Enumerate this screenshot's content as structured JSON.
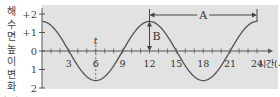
{
  "chart_data": {
    "type": "line",
    "title": "",
    "xlabel": "시간(시)",
    "ylabel": "해수면 높이 변화(m)",
    "ylabel_chars": [
      "해",
      "수",
      "면",
      "높",
      "이",
      "변",
      "화",
      "(m)"
    ],
    "xlim": [
      0,
      24
    ],
    "ylim": [
      -2,
      2
    ],
    "x_ticks": [
      3,
      6,
      9,
      12,
      15,
      18,
      21,
      24
    ],
    "x_tick_labels": [
      "3",
      "6",
      "9",
      "12",
      "15",
      "18",
      "21",
      "24"
    ],
    "y_ticks": [
      2,
      1,
      0,
      -1,
      -2
    ],
    "y_tick_labels": [
      "+2",
      "+1",
      "0",
      "1",
      "2"
    ],
    "series": [
      {
        "name": "해수면 높이 변화",
        "x": [
          0,
          3,
          6,
          9,
          12,
          15,
          18,
          21,
          24
        ],
        "values": [
          1.6,
          0,
          -1.6,
          0,
          1.6,
          0,
          -1.6,
          0,
          1.6
        ]
      }
    ],
    "annotations": [
      {
        "label": "A",
        "type": "horizontal-arrow",
        "from_x": 12,
        "to_x": 24,
        "meaning": "period"
      },
      {
        "label": "B",
        "type": "vertical-arrow",
        "at_x": 12,
        "from_y": 0,
        "to_y": 1.6,
        "meaning": "amplitude"
      },
      {
        "label": "t",
        "type": "marker",
        "at_x": 6
      }
    ],
    "grid": false,
    "background": "#e2e2e2",
    "line_color": "#555555"
  },
  "labels": {
    "xlabel": "시간(시)",
    "A": "A",
    "B": "B",
    "t": "t"
  }
}
